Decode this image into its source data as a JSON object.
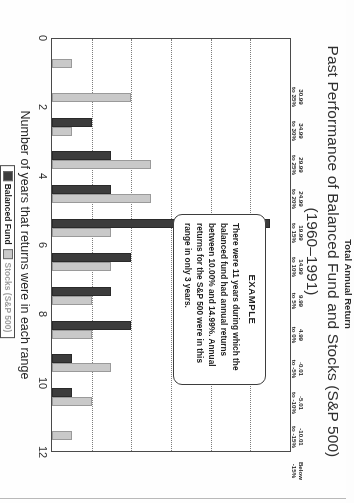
{
  "title": {
    "main": "Past Performance of Balanced Fund and Stocks (S&P 500)",
    "sub": "(1960–1991)"
  },
  "axes": {
    "x_title": "Number of years that returns were in each range",
    "y_title": "Total Annual Return"
  },
  "legend": {
    "fund_label": "Balanced Fund",
    "stocks_label": "Stocks (S&P 500)",
    "fund_color": "#3c3c3c",
    "stocks_color": "#c9c9c9"
  },
  "callout": {
    "title": "EXAMPLE",
    "body": "There were 11 years during which the balanced fund had annual returns between 10.00% and 14.99%.  Annual returns for the S&P 500 were in this range in only 3 years."
  },
  "chart_data": {
    "type": "bar",
    "title": "Past Performance of Balanced Fund and Stocks (S&P 500) (1960–1991)",
    "xlabel": "Number of years that returns were in each range",
    "ylabel": "Total Annual Return",
    "orientation": "horizontal",
    "grid": true,
    "legend_position": "bottom",
    "xlim": [
      0,
      12
    ],
    "xticks": [
      "0",
      "2",
      "4",
      "6",
      "8",
      "10",
      "12"
    ],
    "xtick_values": [
      0,
      2,
      4,
      6,
      8,
      10,
      12
    ],
    "categories": [
      "30.99\nto 35%",
      "34.99\nto 30%",
      "29.99\nto 25%",
      "24.99\nto 20%",
      "19.99\nto 15%",
      "14.99\nto 10%",
      "9.99\nto 5%",
      "4.99\nto 0%",
      "-0.01\nto -5%",
      "-5.01\nto -10%",
      "-10.01\nto -15%",
      "Below\n-15%"
    ],
    "category_lines": [
      [
        "30.99",
        "to 35%"
      ],
      [
        "34.99",
        "to 30%"
      ],
      [
        "29.99",
        "to 25%"
      ],
      [
        "24.99",
        "to 20%"
      ],
      [
        "19.99",
        "to 15%"
      ],
      [
        "14.99",
        "to 10%"
      ],
      [
        "9.99",
        "to 5%"
      ],
      [
        "4.99",
        "to 0%"
      ],
      [
        "-0.01",
        "to -5%"
      ],
      [
        "-5.01",
        "to -10%"
      ],
      [
        "-10.01",
        "to -15%"
      ],
      [
        "Below",
        "-15%"
      ]
    ],
    "series": [
      {
        "name": "Balanced Fund",
        "color": "#3c3c3c",
        "values": [
          0,
          0,
          2,
          3,
          3,
          11,
          4,
          3,
          4,
          1,
          1,
          0
        ]
      },
      {
        "name": "Stocks (S&P 500)",
        "color": "#c9c9c9",
        "values": [
          1,
          4,
          1,
          5,
          5,
          3,
          3,
          2,
          2,
          3,
          2,
          1
        ]
      }
    ]
  }
}
